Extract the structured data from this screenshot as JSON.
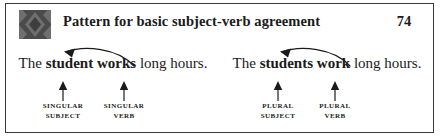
{
  "header": {
    "icon": "diamond-pattern-icon",
    "title": "Pattern for basic subject-verb agreement",
    "page_number": "74"
  },
  "colors": {
    "frame": "#3a3a3a",
    "icon_background": "#4a4a4a",
    "icon_diamond": "#6e6e6e",
    "text": "#1b1b1b",
    "arrow": "#1b1b1b",
    "page_background": "#ffffff"
  },
  "examples": [
    {
      "id": "singular-example",
      "sentence": {
        "lead": "The ",
        "subject": "student",
        "space": " ",
        "verb": "works",
        "tail": " long hours."
      },
      "subject_label": {
        "line1": "SINGULAR",
        "line2": "SUBJECT"
      },
      "verb_label": {
        "line1": "SINGULAR",
        "line2": "VERB"
      },
      "agreement_arrow": "curved-arrow-verb-to-subject"
    },
    {
      "id": "plural-example",
      "sentence": {
        "lead": "The ",
        "subject": "students",
        "space": " ",
        "verb": "work",
        "tail": " long hours."
      },
      "subject_label": {
        "line1": "PLURAL",
        "line2": "SUBJECT"
      },
      "verb_label": {
        "line1": "PLURAL",
        "line2": "VERB"
      },
      "agreement_arrow": "curved-arrow-verb-to-subject"
    }
  ]
}
